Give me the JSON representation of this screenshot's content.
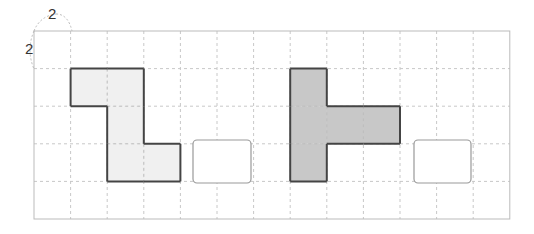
{
  "labels": {
    "top": "2",
    "left": "2"
  },
  "grid": {
    "x0": 34,
    "y0": 31,
    "cols": 13,
    "rows": 5,
    "cell_w": 36.6,
    "cell_h": 37.6,
    "border_color": "#bbbbbb",
    "line_color": "#c8c8c8"
  },
  "shapes": [
    {
      "name": "light-l-shape",
      "fill": "#f0f0f0",
      "stroke": "#444444",
      "cells": [
        [
          1,
          1
        ],
        [
          2,
          1
        ],
        [
          2,
          2
        ],
        [
          2,
          3
        ],
        [
          3,
          3
        ]
      ]
    },
    {
      "name": "dark-t-shape",
      "fill": "#c8c8c8",
      "stroke": "#444444",
      "cells": [
        [
          7,
          1
        ],
        [
          7,
          2
        ],
        [
          7,
          3
        ],
        [
          8,
          2
        ],
        [
          9,
          2
        ]
      ]
    }
  ],
  "answer_boxes": [
    {
      "name": "answer-box-1",
      "x": 193,
      "y": 140,
      "w": 58,
      "h": 43
    },
    {
      "name": "answer-box-2",
      "x": 414,
      "y": 140,
      "w": 57,
      "h": 43
    }
  ]
}
